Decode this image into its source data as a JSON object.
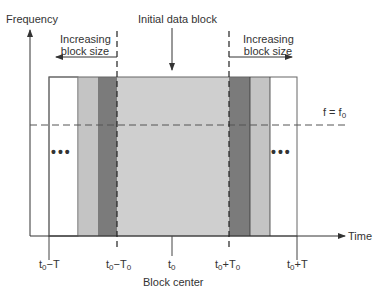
{
  "labels": {
    "y_axis": "Frequency",
    "x_axis": "Time",
    "initial_block": "Initial data block",
    "increasing_left_line1": "Increasing",
    "increasing_left_line2": "block size",
    "increasing_right_line1": "Increasing",
    "increasing_right_line2": "block size",
    "freq_line_f": "f = f",
    "freq_line_sub": "0",
    "block_center": "Block center",
    "dots_left": "•••",
    "dots_right": "•••"
  },
  "ticks": [
    {
      "base": "t",
      "sub": "0",
      "suffix": "−T",
      "suffix_sub": ""
    },
    {
      "base": "t",
      "sub": "0",
      "suffix": "−T",
      "suffix_sub": "0"
    },
    {
      "base": "t",
      "sub": "0",
      "suffix": "",
      "suffix_sub": ""
    },
    {
      "base": "t",
      "sub": "0",
      "suffix": "+T",
      "suffix_sub": "0"
    },
    {
      "base": "t",
      "sub": "0",
      "suffix": "+T",
      "suffix_sub": ""
    }
  ],
  "colors": {
    "white_block": "#ffffff",
    "light_gray_block": "#c4c4c4",
    "dark_gray_block": "#7b7b7b",
    "center_block": "#cfcfcf",
    "outline": "#555555"
  }
}
